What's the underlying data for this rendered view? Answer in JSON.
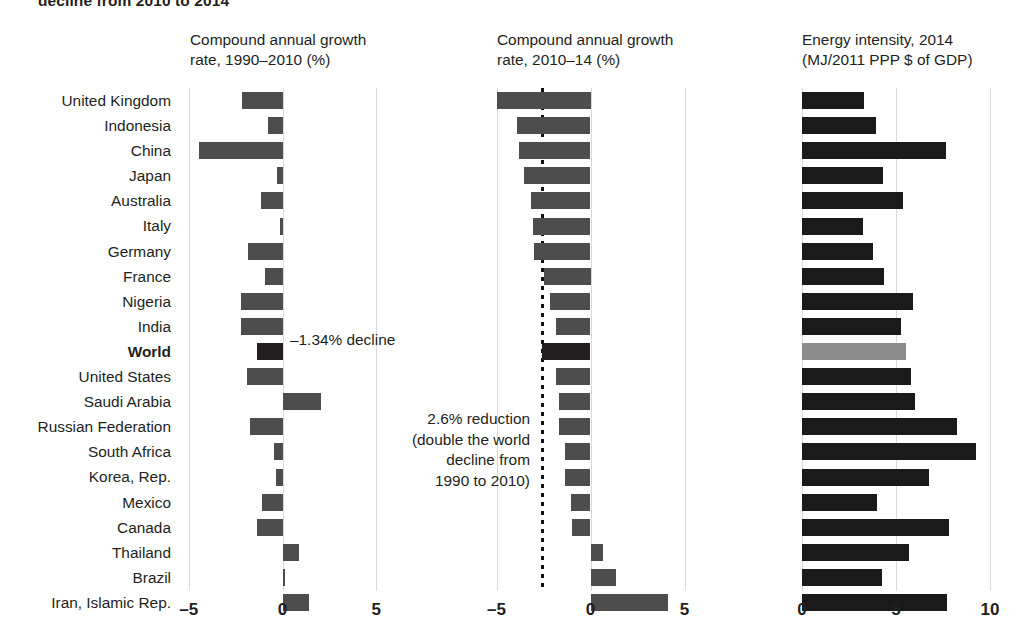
{
  "figure": {
    "title": "decline from 2010 to 2014",
    "panels": [
      {
        "id": "p1",
        "header": "Compound annual growth\nrate, 1990–2010 (%)"
      },
      {
        "id": "p2",
        "header": "Compound annual growth\nrate, 2010–14 (%)"
      },
      {
        "id": "p3",
        "header": "Energy intensity, 2014\n(MJ/2011 PPP $ of GDP)"
      }
    ]
  },
  "annotations": {
    "world_decline": "–1.34% decline",
    "reduction": "2.6% reduction\n(double the world\ndecline from\n1990 to 2010)"
  },
  "colors": {
    "bar_default": "#4d4d4d",
    "bar_world_dark": "#231f20",
    "bar_world_light": "#8c8c8c",
    "bar_intensity": "#1a1a1a",
    "gridline": "#d9d9d9",
    "dotted_reference": "#111111",
    "text": "#231f20"
  },
  "chart_data": {
    "type": "bar",
    "title": "decline from 2010 to 2014",
    "orientation": "horizontal",
    "grid": true,
    "legend_position": "none",
    "categories": [
      "United Kingdom",
      "Indonesia",
      "China",
      "Japan",
      "Australia",
      "Italy",
      "Germany",
      "France",
      "Nigeria",
      "India",
      "World",
      "United States",
      "Saudi Arabia",
      "Russian Federation",
      "South Africa",
      "Korea, Rep.",
      "Mexico",
      "Canada",
      "Thailand",
      "Brazil",
      "Iran, Islamic Rep."
    ],
    "highlight_category": "World",
    "panels": [
      {
        "name": "cagr_1990_2010",
        "title": "Compound annual growth\nrate, 1990–2010 (%)",
        "xlabel": "",
        "ylabel": "",
        "xlim": [
          -5,
          5
        ],
        "xticks": [
          -5,
          0,
          5
        ],
        "xticklabels": [
          "–5",
          "0",
          "5"
        ],
        "values": [
          -2.14,
          -0.8,
          -4.48,
          -0.31,
          -1.17,
          -0.16,
          -1.82,
          -0.91,
          -2.19,
          -2.19,
          -1.34,
          -1.87,
          2.03,
          -1.74,
          -0.43,
          -0.37,
          -1.07,
          -1.36,
          0.86,
          0.11,
          1.39
        ],
        "annotation": "–1.34% decline"
      },
      {
        "name": "cagr_2010_2014",
        "title": "Compound annual growth\nrate, 2010–14 (%)",
        "xlabel": "",
        "ylabel": "",
        "xlim": [
          -5,
          5
        ],
        "xticks": [
          -5,
          0,
          5
        ],
        "xticklabels": [
          "–5",
          "0",
          "5"
        ],
        "reference_line": -2.6,
        "reference_line_style": "dotted",
        "values": [
          -5.0,
          -3.93,
          -3.78,
          -3.55,
          -3.16,
          -3.07,
          -3.03,
          -2.5,
          -2.18,
          -1.86,
          -2.6,
          -1.86,
          -1.7,
          -1.7,
          -1.38,
          -1.33,
          -1.06,
          -0.96,
          0.69,
          1.33,
          4.1
        ],
        "annotation": "2.6% reduction\n(double the world\ndecline from\n1990 to 2010)"
      },
      {
        "name": "energy_intensity_2014",
        "title": "Energy intensity, 2014\n(MJ/2011 PPP $ of GDP)",
        "xlabel": "",
        "ylabel": "",
        "xlim": [
          0,
          10
        ],
        "xticks": [
          0,
          5,
          10
        ],
        "xticklabels": [
          "0",
          "5",
          "10"
        ],
        "values": [
          3.3,
          3.94,
          7.66,
          4.29,
          5.39,
          3.23,
          3.79,
          4.36,
          5.89,
          5.25,
          5.53,
          5.78,
          6.01,
          8.23,
          9.26,
          6.77,
          3.97,
          7.84,
          5.71,
          4.24,
          7.73
        ]
      }
    ]
  }
}
